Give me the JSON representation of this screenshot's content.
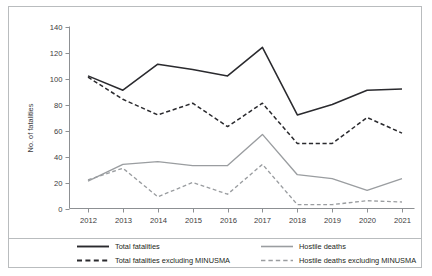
{
  "chart_data": {
    "type": "line",
    "title": "",
    "xlabel": "",
    "ylabel": "No. of fatalities",
    "categories": [
      "2012",
      "2013",
      "2014",
      "2015",
      "2016",
      "2017",
      "2018",
      "2019",
      "2020",
      "2021"
    ],
    "ylim": [
      0,
      140
    ],
    "yticks": [
      0,
      20,
      40,
      60,
      80,
      100,
      120,
      140
    ],
    "grid": false,
    "legend_position": "bottom",
    "series": [
      {
        "name": "Total fatalities",
        "style": "solid",
        "color": "#2a2a2e",
        "values": [
          102,
          91,
          111,
          107,
          102,
          124,
          72,
          80,
          91,
          92
        ]
      },
      {
        "name": "Total fatalities excluding MINUSMA",
        "style": "dashed",
        "color": "#2a2a2e",
        "values": [
          101,
          84,
          72,
          81,
          63,
          81,
          50,
          50,
          70,
          58
        ]
      },
      {
        "name": "Hostile deaths",
        "style": "solid",
        "color": "#9a9da0",
        "values": [
          21,
          34,
          36,
          33,
          33,
          57,
          26,
          23,
          14,
          23
        ]
      },
      {
        "name": "Hostile deaths excluding MINUSMA",
        "style": "dashed",
        "color": "#9a9da0",
        "values": [
          22,
          31,
          9,
          20,
          11,
          34,
          3,
          3,
          6,
          5
        ]
      }
    ]
  },
  "axis": {
    "y_label": "No. of fatalities",
    "y_ticks": [
      "0",
      "20",
      "40",
      "60",
      "80",
      "100",
      "120",
      "140"
    ],
    "x_ticks": [
      "2012",
      "2013",
      "2014",
      "2015",
      "2016",
      "2017",
      "2018",
      "2019",
      "2020",
      "2021"
    ]
  },
  "legend": {
    "items": [
      {
        "label": "Total fatalities",
        "style": "solid",
        "color": "#2a2a2e"
      },
      {
        "label": "Total fatalities excluding MINUSMA",
        "style": "dashed",
        "color": "#2a2a2e"
      },
      {
        "label": "Hostile deaths",
        "style": "solid",
        "color": "#9a9da0"
      },
      {
        "label": "Hostile deaths excluding MINUSMA",
        "style": "dashed",
        "color": "#9a9da0"
      }
    ]
  }
}
